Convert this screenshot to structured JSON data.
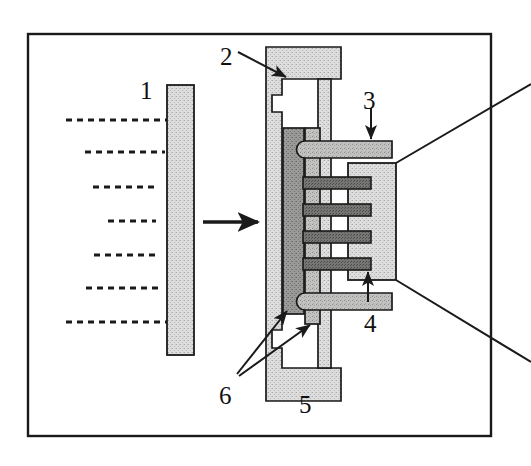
{
  "figure": {
    "background_color": "#ffffff",
    "frame": {
      "name": "outer-border",
      "x": 27,
      "y": 33,
      "width": 465,
      "height": 404,
      "stroke": "#1a1a1a",
      "stroke_width": 2.4,
      "fill": "none"
    },
    "colors": {
      "ink": "#1a1a1a",
      "light_hatch": "#d8d8d6",
      "mid_hatch": "#bdbdbb",
      "dark_hatch": "#8f8f8d",
      "darkest_hatch": "#707070",
      "white": "#ffffff"
    },
    "labels": [
      {
        "name": "callout-label-1",
        "text": "1",
        "x": 140,
        "y": 78,
        "note": "source plate / target slab"
      },
      {
        "name": "callout-label-2",
        "text": "2",
        "x": 220,
        "y": 44,
        "note": "housing cavity, arrow points down-right into notch"
      },
      {
        "name": "callout-label-3",
        "text": "3",
        "x": 363,
        "y": 88,
        "note": "upper fin, arrow points down"
      },
      {
        "name": "callout-label-4",
        "text": "4",
        "x": 364,
        "y": 311,
        "note": "lower fin, arrow points up"
      },
      {
        "name": "callout-label-5",
        "text": "5",
        "x": 299,
        "y": 392,
        "note": "base of housing, no leader"
      },
      {
        "name": "callout-label-6",
        "text": "6",
        "x": 219,
        "y": 383,
        "note": "two leader arrows to stacked bars"
      }
    ],
    "dashed_beam_lines": {
      "name": "incident-beam-dashed-lines",
      "count": 7,
      "stroke": "#1a1a1a",
      "stroke_width": 2.6,
      "dash_pattern": "6 5",
      "x_right_end": 170,
      "lines": [
        {
          "y": 120,
          "x_start": 66
        },
        {
          "y": 152,
          "x_start": 85
        },
        {
          "y": 187,
          "x_start": 93
        },
        {
          "y": 221,
          "x_start": 108
        },
        {
          "y": 255,
          "x_start": 94
        },
        {
          "y": 288,
          "x_start": 86
        },
        {
          "y": 322,
          "x_start": 66
        }
      ]
    },
    "flow_arrow": {
      "name": "direction-arrow",
      "x_start": 203,
      "x_end": 262,
      "y": 222,
      "stroke": "#1a1a1a",
      "stroke_width": 3.4
    },
    "plate_1": {
      "name": "source-plate",
      "x": 167,
      "y": 85,
      "width": 27,
      "height": 270,
      "fill": "light_hatch",
      "stroke": "#1a1a1a",
      "stroke_width": 1.8
    },
    "housing_5": {
      "name": "housing-frame",
      "top_bar": {
        "x": 266,
        "y": 47,
        "width": 75,
        "height": 32
      },
      "bottom_bar": {
        "x": 266,
        "y": 368,
        "width": 75,
        "height": 33
      },
      "left_wall": {
        "x": 266,
        "y": 47,
        "width": 16,
        "height": 354
      },
      "inner_wall": {
        "x": 318,
        "y": 79,
        "width": 12,
        "height": 289
      },
      "fill": "light_hatch",
      "stroke": "#1a1a1a",
      "stroke_width": 1.7
    },
    "stack_bars": {
      "name": "vertical-stack-bars",
      "dark_bar": {
        "x": 283,
        "y": 128,
        "width": 20,
        "height": 186,
        "fill": "dark_hatch"
      },
      "mid_bar": {
        "x": 305,
        "y": 128,
        "width": 15,
        "height": 196,
        "fill": "mid_hatch"
      },
      "stroke": "#1a1a1a",
      "stroke_width": 1.7
    },
    "right_block": {
      "name": "right-body-block",
      "x": 348,
      "y": 163,
      "width": 48,
      "height": 117,
      "fill": "light_hatch",
      "stroke": "#1a1a1a",
      "stroke_width": 1.8
    },
    "fins": {
      "name": "interdigitated-fins",
      "stroke": "#1a1a1a",
      "stroke_width": 1.7,
      "outer": [
        {
          "name": "fin-top-outer",
          "x": 299,
          "y": 141,
          "width": 93,
          "height": 16,
          "fill": "mid_hatch",
          "rounded_left": true
        },
        {
          "name": "fin-bottom-outer",
          "x": 299,
          "y": 294,
          "width": 93,
          "height": 16,
          "fill": "mid_hatch",
          "rounded_left": true
        }
      ],
      "inner": [
        {
          "name": "fin-inner-1",
          "x": 303,
          "y": 178,
          "width": 68,
          "height": 11,
          "fill": "darkest_hatch"
        },
        {
          "name": "fin-inner-2",
          "x": 303,
          "y": 205,
          "width": 68,
          "height": 11,
          "fill": "darkest_hatch"
        },
        {
          "name": "fin-inner-3",
          "x": 303,
          "y": 232,
          "width": 68,
          "height": 11,
          "fill": "darkest_hatch"
        },
        {
          "name": "fin-inner-4",
          "x": 303,
          "y": 259,
          "width": 68,
          "height": 11,
          "fill": "darkest_hatch"
        }
      ]
    },
    "leader_lines": {
      "name": "callout-leader-lines",
      "stroke": "#1a1a1a",
      "stroke_width": 2.0,
      "arrow_2": {
        "from_x": 238,
        "from_y": 52,
        "to_x": 288,
        "to_y": 78
      },
      "arrow_3": {
        "from_x": 371,
        "from_y": 110,
        "to_x": 371,
        "to_y": 142
      },
      "arrow_4": {
        "from_x": 368,
        "from_y": 300,
        "to_x": 368,
        "to_y": 272
      },
      "arrow_6a": {
        "from_x": 238,
        "from_y": 374,
        "to_x": 288,
        "to_y": 310
      },
      "arrow_6b": {
        "from_x": 240,
        "from_y": 376,
        "to_x": 309,
        "to_y": 325
      }
    },
    "exploded_lines": {
      "name": "magnification-leader-lines",
      "stroke": "#1a1a1a",
      "stroke_width": 2.0,
      "upper": {
        "x1": 396,
        "y1": 163,
        "x2": 531,
        "y2": 84
      },
      "lower": {
        "x1": 396,
        "y1": 280,
        "x2": 531,
        "y2": 362
      }
    }
  }
}
